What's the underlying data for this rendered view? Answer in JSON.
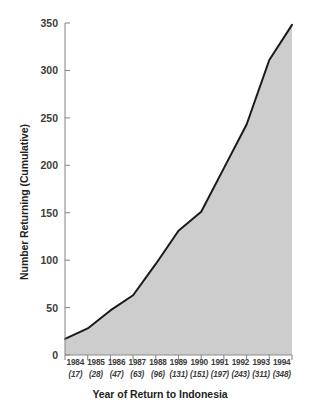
{
  "chart_data": {
    "type": "area",
    "title": "",
    "xlabel": "Year of Return to Indonesia",
    "ylabel": "Number Returning (Cumulative)",
    "categories": [
      "1984",
      "1985",
      "1986",
      "1987",
      "1988",
      "1989",
      "1990",
      "1991",
      "1992",
      "1993",
      "1994"
    ],
    "values": [
      17,
      28,
      47,
      63,
      96,
      131,
      151,
      197,
      243,
      311,
      348
    ],
    "point_labels": [
      "(17)",
      "(28)",
      "(47)",
      "(63)",
      "(96)",
      "(131)",
      "(151)",
      "(197)",
      "(243)",
      "(311)",
      "(348)"
    ],
    "xlim": [
      "1984",
      "1994"
    ],
    "ylim": [
      0,
      350
    ],
    "yticks": [
      0,
      50,
      100,
      150,
      200,
      250,
      300,
      350
    ],
    "ytick_labels": [
      "0",
      "50",
      "100",
      "150",
      "200",
      "250",
      "300",
      "350"
    ],
    "grid": false,
    "legend": null,
    "colors": {
      "area_fill": "#cdcdcd",
      "line": "#1a1a1a",
      "axis": "#8c8c8c",
      "text": "#3c3c3b",
      "background": "#ffffff"
    }
  }
}
